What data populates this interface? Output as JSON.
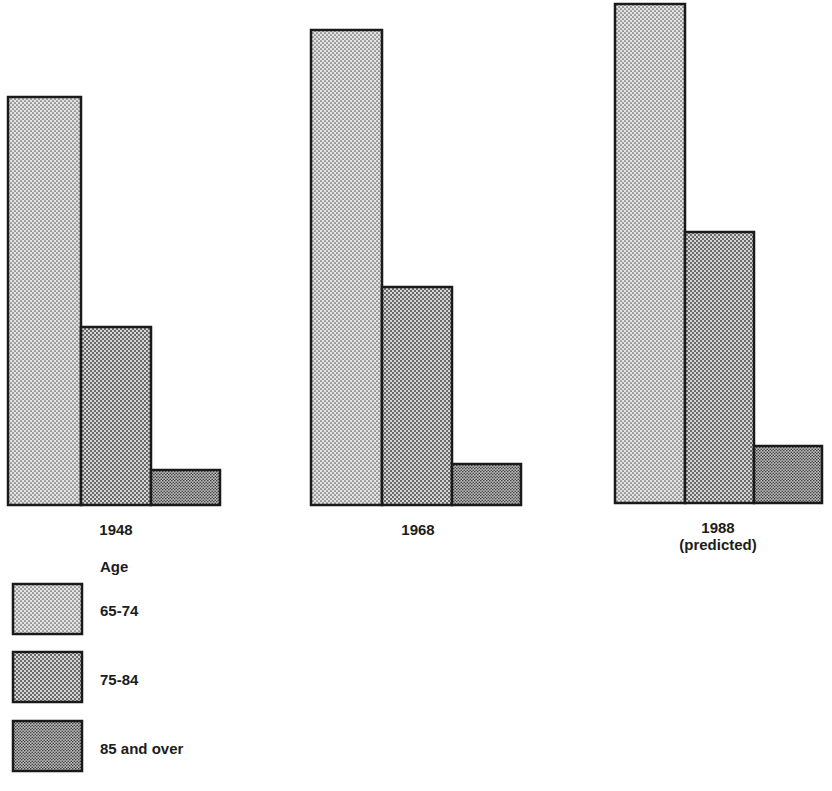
{
  "chart_data": {
    "type": "bar",
    "title": "",
    "xlabel": "",
    "ylabel": "",
    "grid": false,
    "axes_visible": false,
    "value_units": "relative bar height (px, no scale shown)",
    "categories": [
      "1948",
      "1968",
      "1988"
    ],
    "category_sublabels": [
      "",
      "",
      "(predicted)"
    ],
    "legend_title": "Age",
    "legend_position": "bottom-left",
    "series": [
      {
        "name": "65-74",
        "values": [
          408,
          475,
          499
        ],
        "pattern": "light-dots"
      },
      {
        "name": "75-84",
        "values": [
          178,
          218,
          271
        ],
        "pattern": "medium-dots"
      },
      {
        "name": "85 and over",
        "values": [
          35,
          41,
          57
        ],
        "pattern": "dark-fine-dots"
      }
    ]
  },
  "layout": {
    "groups": [
      {
        "x": 8,
        "baseline": 505,
        "bar_widths": [
          73,
          70,
          69
        ]
      },
      {
        "x": 311,
        "baseline": 505,
        "bar_widths": [
          71,
          70,
          69
        ]
      },
      {
        "x": 615,
        "baseline": 503,
        "bar_widths": [
          70,
          69,
          68
        ]
      }
    ],
    "label_y": 522,
    "sublabel_y": 539
  },
  "labels": {
    "group_1": "1948",
    "group_2": "1968",
    "group_3": "1988",
    "group_3_sub": "(predicted)"
  },
  "legend": {
    "title": "Age",
    "items": [
      {
        "label": "65-74"
      },
      {
        "label": "75-84"
      },
      {
        "label": "85 and over"
      }
    ]
  }
}
